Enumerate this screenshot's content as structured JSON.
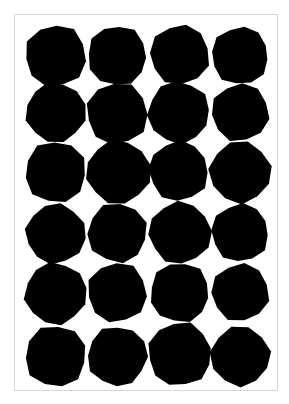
{
  "artwork": {
    "subject": "polka-dot-print",
    "frame_color": "#d6d6d6",
    "background_color": "#ffffff",
    "dot_color": "#000000",
    "columns": 4,
    "rows": 6,
    "dots": [
      {
        "cx": 41,
        "cy": 41,
        "r": 31,
        "sides": 11,
        "rot": 10
      },
      {
        "cx": 103,
        "cy": 41,
        "r": 30,
        "sides": 12,
        "rot": 4
      },
      {
        "cx": 166,
        "cy": 40,
        "r": 30,
        "sides": 11,
        "rot": 20
      },
      {
        "cx": 227,
        "cy": 41,
        "r": 29,
        "sides": 12,
        "rot": 8
      },
      {
        "cx": 41,
        "cy": 98,
        "r": 30,
        "sides": 12,
        "rot": 15
      },
      {
        "cx": 103,
        "cy": 99,
        "r": 31,
        "sides": 11,
        "rot": 2
      },
      {
        "cx": 165,
        "cy": 98,
        "r": 31,
        "sides": 12,
        "rot": 25
      },
      {
        "cx": 227,
        "cy": 98,
        "r": 29,
        "sides": 11,
        "rot": 12
      },
      {
        "cx": 41,
        "cy": 158,
        "r": 31,
        "sides": 11,
        "rot": 6
      },
      {
        "cx": 104,
        "cy": 158,
        "r": 32,
        "sides": 12,
        "rot": 18
      },
      {
        "cx": 165,
        "cy": 157,
        "r": 30,
        "sides": 12,
        "rot": 3
      },
      {
        "cx": 227,
        "cy": 158,
        "r": 31,
        "sides": 11,
        "rot": 22
      },
      {
        "cx": 41,
        "cy": 220,
        "r": 30,
        "sides": 12,
        "rot": 9
      },
      {
        "cx": 103,
        "cy": 219,
        "r": 30,
        "sides": 11,
        "rot": 14
      },
      {
        "cx": 166,
        "cy": 219,
        "r": 31,
        "sides": 12,
        "rot": 27
      },
      {
        "cx": 227,
        "cy": 219,
        "r": 29,
        "sides": 12,
        "rot": 5
      },
      {
        "cx": 41,
        "cy": 280,
        "r": 31,
        "sides": 12,
        "rot": 20
      },
      {
        "cx": 103,
        "cy": 279,
        "r": 30,
        "sides": 11,
        "rot": 7
      },
      {
        "cx": 166,
        "cy": 279,
        "r": 30,
        "sides": 12,
        "rot": 11
      },
      {
        "cx": 227,
        "cy": 279,
        "r": 29,
        "sides": 11,
        "rot": 16
      },
      {
        "cx": 41,
        "cy": 343,
        "r": 31,
        "sides": 11,
        "rot": 13
      },
      {
        "cx": 103,
        "cy": 343,
        "r": 30,
        "sides": 12,
        "rot": 1
      },
      {
        "cx": 166,
        "cy": 341,
        "r": 32,
        "sides": 12,
        "rot": 19
      },
      {
        "cx": 227,
        "cy": 343,
        "r": 30,
        "sides": 11,
        "rot": 24
      }
    ]
  }
}
